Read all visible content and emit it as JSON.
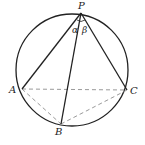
{
  "diagram": {
    "type": "geometry",
    "points": {
      "P": {
        "label": "P",
        "x": 81,
        "y": 13
      },
      "A": {
        "label": "A",
        "x": 22,
        "y": 89
      },
      "B": {
        "label": "B",
        "x": 61,
        "y": 124
      },
      "C": {
        "label": "C",
        "x": 127,
        "y": 90
      }
    },
    "angles": {
      "alpha": {
        "label": "α",
        "between": [
          "PA",
          "PB"
        ]
      },
      "beta": {
        "label": "β",
        "between": [
          "PB",
          "PC"
        ]
      }
    },
    "circle": {
      "cx": 72,
      "cy": 70,
      "r": 56
    },
    "solid_segments": [
      "PA",
      "PB",
      "PC"
    ],
    "dashed_segments": [
      "AC",
      "AB",
      "BC"
    ],
    "colors": {
      "stroke": "#222222",
      "dashed": "#9a9a9a"
    }
  }
}
